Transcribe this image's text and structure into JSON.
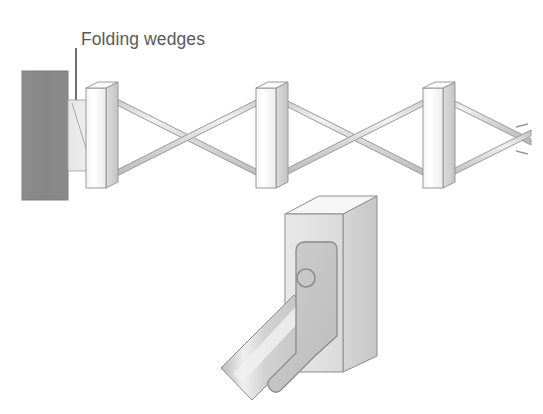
{
  "figure": {
    "type": "technical-illustration",
    "background_color": "#ffffff"
  },
  "annotations": {
    "folding_wedges": {
      "text": "Folding wedges",
      "text_color": "#595959",
      "leader_line_color": "#4a4a4a"
    }
  },
  "palette": {
    "wall_fill": "#8a8a8a",
    "wall_stroke": "#787878",
    "wedge_fill": "#e9e9e9",
    "wedge_stroke": "#9a9a9a",
    "slat_front_fill": "#fcfcfc",
    "slat_side_fill": "#d8d8d8",
    "slat_stroke": "#8f8f8f",
    "bar_fill": "#cfcfcf",
    "bar_highlight": "#efefef",
    "bar_stroke": "#9b9b9b",
    "box_front_fill": "#e2e2e2",
    "box_side_fill": "#d0d0d0",
    "box_top_fill": "#f6f6f6",
    "box_stroke": "#8d8d8d",
    "bracket_fill": "#c9c9c9",
    "bracket_stroke": "#8a8a8a",
    "detail_bar_fill": "#c6c6c6",
    "detail_bar_highlight": "#ededed",
    "hole_stroke": "#8a8a8a"
  },
  "lattice": {
    "description": "Scissor-action expanding lattice (lazy tongs) with three vertical slats and crossed diagonal bars",
    "slat_count": 3,
    "slat_x_positions": [
      100,
      270,
      437
    ],
    "slat_top_y": 85,
    "slat_bottom_y": 186,
    "slat_width": 20,
    "crossing_points_x": [
      185,
      353,
      520
    ],
    "bar_thickness": 6
  },
  "wall": {
    "x": 22,
    "y": 71,
    "width": 46,
    "height": 129
  },
  "wedges": {
    "count": 1,
    "x": 68,
    "top_y": 100,
    "bottom_y": 171,
    "width": 26
  },
  "detail_view": {
    "description": "Enlarged detail: rectangular post with angled bracket plate, pin hole, and diagonal lattice bar",
    "post": {
      "front_x": 285,
      "front_y": 214,
      "front_width": 58,
      "front_height": 158,
      "depth_x": 34,
      "depth_y": -26
    },
    "pin_hole": {
      "cx": 306,
      "cy": 278,
      "r": 9
    },
    "diagonal_bar_angle_deg": 52
  }
}
